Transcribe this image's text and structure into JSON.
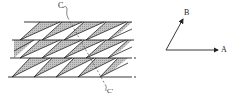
{
  "figure": {
    "type": "lattice-diagram",
    "labels": {
      "cut_top": "C",
      "cut_bottom": "C'",
      "vector_a": "A",
      "vector_b": "B"
    },
    "colors": {
      "line": "#222222",
      "shade": "#b8b8b8",
      "background": "#ffffff"
    },
    "rows": 3,
    "row_lines_y": [
      22,
      40,
      58,
      77
    ],
    "vectors": {
      "origin": [
        166,
        50
      ],
      "a_tip": [
        220,
        50
      ],
      "b_tip": [
        184,
        17
      ]
    },
    "cut_line": {
      "start": [
        68,
        18
      ],
      "end": [
        106,
        86
      ]
    }
  }
}
